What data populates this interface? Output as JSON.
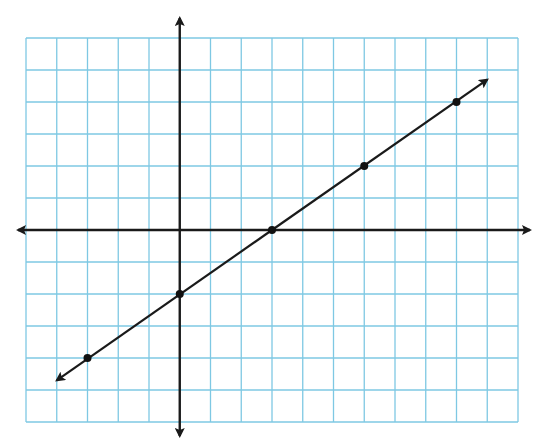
{
  "chart_data": {
    "type": "line",
    "title": "",
    "subtitle": "",
    "xlabel": "",
    "ylabel": "",
    "xlim": [
      -5,
      11
    ],
    "ylim": [
      -6,
      6
    ],
    "grid": true,
    "legend": null,
    "x_tick_labels": [],
    "y_tick_labels": [],
    "series": [
      {
        "name": "line",
        "equation": "y = (2/3)x - 2",
        "slope": 0.6667,
        "y_intercept": -2,
        "x_intercept": 3,
        "arrows_both_ends": true,
        "line_extent": {
          "x_start": -4.0,
          "y_start": -4.7,
          "x_end": 10.0,
          "y_end": 4.7
        },
        "points": [
          {
            "x": -3,
            "y": -4
          },
          {
            "x": 0,
            "y": -2
          },
          {
            "x": 3,
            "y": 0
          },
          {
            "x": 6,
            "y": 2
          },
          {
            "x": 9,
            "y": 4
          }
        ]
      }
    ]
  },
  "layout": {
    "grid_left_px": 26,
    "grid_top_px": 38,
    "cell_w_px": 30.75,
    "cell_h_px": 32,
    "cols": 16,
    "rows": 12,
    "origin_col": 5,
    "origin_row": 6,
    "x_axis_extent_px": [
      18,
      530
    ],
    "y_axis_extent_px": [
      18,
      436
    ]
  },
  "colors": {
    "grid": "#7ec8e3",
    "axes": "#1a1a1a",
    "line": "#1a1a1a",
    "points": "#111111",
    "background": "#ffffff"
  },
  "labels": {
    "graph": "Coordinate grid with line",
    "x_axis": "x-axis",
    "y_axis": "y-axis"
  }
}
